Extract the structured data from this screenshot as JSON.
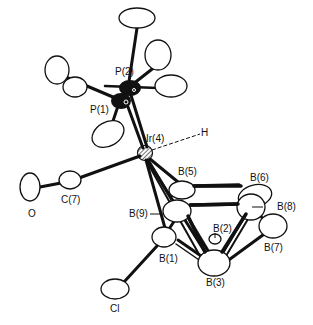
{
  "figure": {
    "type": "ORTEP molecular structure",
    "atoms": [
      {
        "id": "P2",
        "label": "P(2)"
      },
      {
        "id": "P1",
        "label": "P(1)"
      },
      {
        "id": "Ir4",
        "label": "Ir(4)"
      },
      {
        "id": "H",
        "label": "H"
      },
      {
        "id": "C7",
        "label": "C(7)"
      },
      {
        "id": "O",
        "label": "O"
      },
      {
        "id": "B5",
        "label": "B(5)"
      },
      {
        "id": "B6",
        "label": "B(6)"
      },
      {
        "id": "B8",
        "label": "B(8)"
      },
      {
        "id": "B9",
        "label": "B(9)"
      },
      {
        "id": "B2",
        "label": "B(2)"
      },
      {
        "id": "B7",
        "label": "B(7)"
      },
      {
        "id": "B1",
        "label": "B(1)"
      },
      {
        "id": "B3",
        "label": "B(3)"
      },
      {
        "id": "Cl",
        "label": "Cl"
      }
    ]
  }
}
